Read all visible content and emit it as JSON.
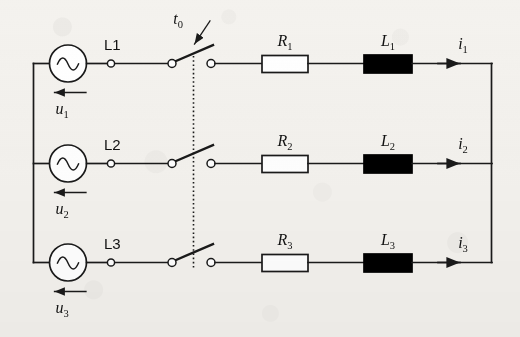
{
  "diagram": {
    "type": "electrical-schematic",
    "stroke_color": "#1a1a1a",
    "inductor_fill": "#000000",
    "resistor_fill": "#ffffff",
    "background_color": "#f4f2ee"
  },
  "labels": {
    "switch_time": "t",
    "switch_time_sub": "0",
    "phase1": "L1",
    "phase2": "L2",
    "phase3": "L3",
    "voltage1": "u",
    "voltage1_sub": "1",
    "voltage2": "u",
    "voltage2_sub": "2",
    "voltage3": "u",
    "voltage3_sub": "3",
    "resistor1": "R",
    "resistor1_sub": "1",
    "resistor2": "R",
    "resistor2_sub": "2",
    "resistor3": "R",
    "resistor3_sub": "3",
    "inductor1": "L",
    "inductor1_sub": "1",
    "inductor2": "L",
    "inductor2_sub": "2",
    "inductor3": "L",
    "inductor3_sub": "3",
    "current1": "i",
    "current1_sub": "1",
    "current2": "i",
    "current2_sub": "2",
    "current3": "i",
    "current3_sub": "3"
  },
  "components": {
    "source1": "ac-voltage-source",
    "source2": "ac-voltage-source",
    "source3": "ac-voltage-source",
    "switch1": "open-switch",
    "switch2": "open-switch",
    "switch3": "open-switch",
    "gang_link": "dashed-ganged-link"
  }
}
